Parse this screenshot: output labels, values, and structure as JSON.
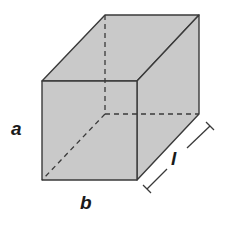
{
  "diagram": {
    "type": "rectangular-prism",
    "fill_color": "#c9c9c9",
    "stroke_color": "#3a3a3a",
    "labels": {
      "height": "a",
      "width": "b",
      "length": "l"
    }
  }
}
